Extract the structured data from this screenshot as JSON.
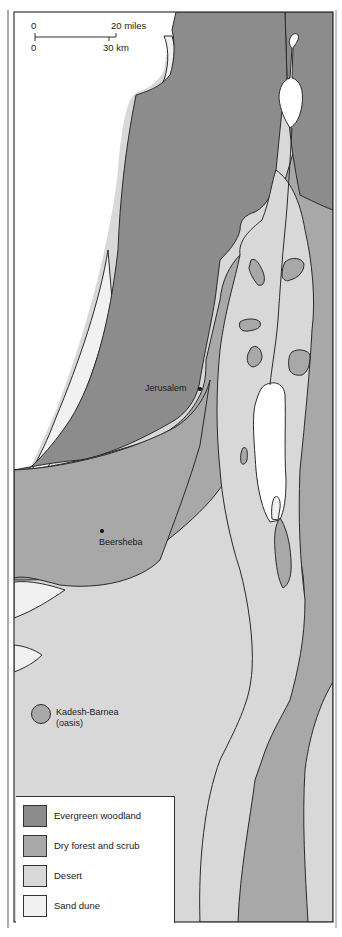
{
  "colors": {
    "evergreen_woodland": "#8c8c8c",
    "dry_forest_and_scrub": "#a8a8a8",
    "desert": "#d8d8d8",
    "sand_dune": "#f1f1f1",
    "water": "#ffffff",
    "outline": "#2a2a2a"
  },
  "scale_bar": {
    "miles_start": "0",
    "miles_end": "20 miles",
    "km_start": "0",
    "km_end": "30 km"
  },
  "places": [
    {
      "name": "Jerusalem"
    },
    {
      "name": "Beersheba"
    },
    {
      "name": "Kadesh-Barnea",
      "note": "(oasis)"
    }
  ],
  "legend": {
    "items": [
      {
        "label": "Evergreen woodland",
        "color": "#8c8c8c"
      },
      {
        "label": "Dry forest and scrub",
        "color": "#a8a8a8"
      },
      {
        "label": "Desert",
        "color": "#d8d8d8"
      },
      {
        "label": "Sand dune",
        "color": "#f1f1f1"
      }
    ]
  }
}
